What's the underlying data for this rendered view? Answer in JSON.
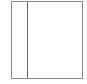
{
  "diagram": {
    "shape": "rectangle",
    "panels": [
      {
        "name": "left-panel"
      },
      {
        "name": "right-panel"
      }
    ],
    "colors": {
      "border": "#8a8a8a",
      "divider": "#6e6e6e",
      "background": "#ffffff"
    }
  }
}
